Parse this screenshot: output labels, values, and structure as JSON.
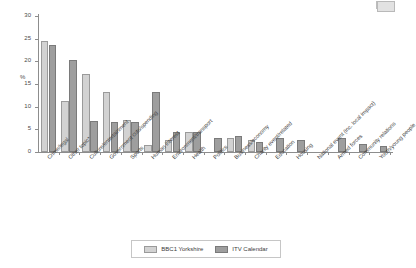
{
  "chart_data": {
    "type": "bar",
    "title": "",
    "xlabel": "",
    "ylabel": "%",
    "ylim": [
      0,
      30
    ],
    "yticks": [
      0,
      5,
      10,
      15,
      20,
      25,
      30
    ],
    "grid": false,
    "legend_position": "bottom",
    "categories": [
      "Crime/legal",
      "Other topic*",
      "Culture/entertainment",
      "Government cuts/spending",
      "Sports",
      "Human interest",
      "Environment/transport",
      "Health",
      "Politics",
      "Business/economy",
      "Charity event/related",
      "Education",
      "Housing",
      "National event (inc. local impact)",
      "Armed forces",
      "Community relations",
      "Youth/young people"
    ],
    "series": [
      {
        "name": "BBC1 Yorkshire",
        "color": "#d2d2d2",
        "values": [
          24.4,
          11.2,
          17.2,
          13.2,
          7.0,
          1.5,
          2.6,
          4.4,
          0,
          3.0,
          2.6,
          0,
          0,
          0,
          0,
          0,
          0
        ]
      },
      {
        "name": "ITV Calendar",
        "color": "#9e9e9e",
        "values": [
          23.6,
          20.2,
          6.8,
          6.6,
          6.6,
          13.3,
          4.4,
          4.4,
          3.0,
          3.5,
          2.2,
          3.0,
          2.6,
          0,
          3.0,
          1.8,
          1.3
        ]
      }
    ]
  },
  "legend": {
    "entries": [
      {
        "label": "BBC1 Yorkshire"
      },
      {
        "label": "ITV Calendar"
      }
    ]
  }
}
